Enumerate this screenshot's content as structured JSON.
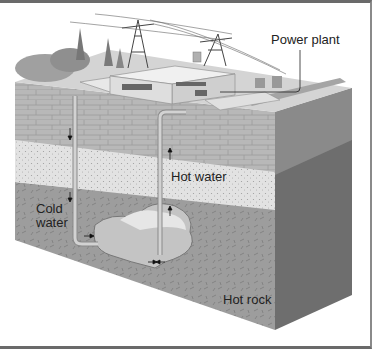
{
  "diagram": {
    "type": "geothermal power plant cross-section",
    "labels": {
      "power_plant": "Power plant",
      "hot_water": "Hot water",
      "cold_water_line1": "Cold",
      "cold_water_line2": "water",
      "hot_rock": "Hot rock"
    },
    "components": [
      "power lines",
      "transmission towers",
      "power plant buildings",
      "trees",
      "injection well pipe",
      "production well pipe",
      "underground reservoir",
      "rock strata"
    ],
    "flow_arrows": [
      "cold water down injection pipe",
      "hot water up production pipe",
      "water flow into reservoir"
    ],
    "colors": {
      "surface": "#d9d9d9",
      "top_strata": "#b5b5b5",
      "sand_layer": "#e4e4e4",
      "hot_rock_front": "#9a9a9a",
      "hot_rock_side": "#6e6e6e",
      "pipe": "#c8c8c8",
      "reservoir": "#c4c4c4"
    }
  }
}
